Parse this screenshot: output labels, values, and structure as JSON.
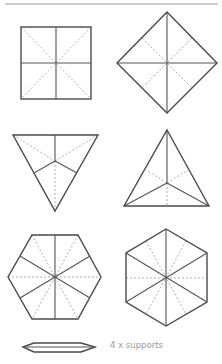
{
  "diagram": {
    "shapes": [
      {
        "name": "square",
        "fold_lines": "solid cross, dashed diagonals"
      },
      {
        "name": "diamond",
        "fold_lines": "solid cross, dashed diagonals"
      },
      {
        "name": "inverted-triangle",
        "fold_lines": "solid to edge midpoints, dashed to vertices"
      },
      {
        "name": "triangle",
        "fold_lines": "solid to vertices, dashed to edge midpoints"
      },
      {
        "name": "hexagon-flat-top",
        "fold_lines": "solid to edge midpoints, dashed to vertices"
      },
      {
        "name": "hexagon-pointy-top",
        "fold_lines": "solid to vertices, dashed to edge midpoints"
      }
    ],
    "support": {
      "label": "4 x supports",
      "quantity": 4
    }
  },
  "colors": {
    "line": "#555555",
    "dashed": "#9a9a9a",
    "label": "#9a9a9a"
  }
}
